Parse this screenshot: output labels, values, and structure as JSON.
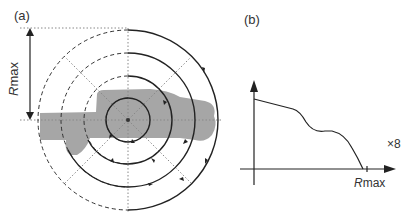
{
  "panel_a": {
    "label": "(a)",
    "rmax_label_italic": "R",
    "rmax_label_rest": "max",
    "center": [
      128,
      120
    ],
    "radii": [
      22,
      44,
      67,
      90
    ],
    "colors": {
      "vehicle": "#a6a6a6",
      "line": "#222222",
      "grid": "#888888"
    }
  },
  "panel_b": {
    "label": "(b)",
    "multiplier": "×8",
    "xaxis_label_italic": "R",
    "xaxis_label_rest": "max"
  }
}
